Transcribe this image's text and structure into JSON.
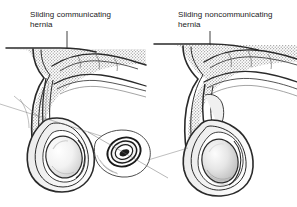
{
  "figure": {
    "background_color": "#ffffff",
    "ink_color": "#1a1a1a",
    "stipple_color": "#9a9a9a",
    "shading_color": "#b5b5b5",
    "width": 297,
    "height": 207,
    "type": "medical-line-illustration"
  },
  "panels": [
    {
      "id": "left",
      "label_line1": "Sliding communicating",
      "label_line2": "hernia",
      "label_x": 30,
      "label_y": 17,
      "arrow": {
        "x": 67,
        "y_start": 31,
        "y_end": 62
      },
      "has_inset": true
    },
    {
      "id": "right",
      "label_line1": "Sliding noncommunicating",
      "label_line2": "hernia",
      "label_x": 178,
      "label_y": 17,
      "arrow": {
        "x": 210,
        "y_start": 31,
        "y_end": 60
      },
      "has_inset": false
    }
  ],
  "inset": {
    "name": "spermatic-cord-cross-section",
    "center_x": 122,
    "center_y": 152,
    "rings": 4
  }
}
